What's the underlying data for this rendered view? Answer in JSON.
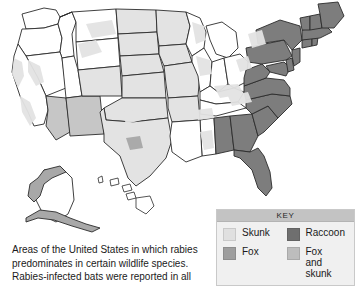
{
  "figure": {
    "kind": "thematic-map",
    "region": "United States"
  },
  "legend": {
    "header": "KEY",
    "entries": [
      {
        "label": "Skunk",
        "color": "#e0e0e0",
        "swatch_name": "swatch-skunk"
      },
      {
        "label": "Raccoon",
        "color": "#6f6f6f",
        "swatch_name": "swatch-raccoon"
      },
      {
        "label": "Fox",
        "color": "#9e9e9e",
        "swatch_name": "swatch-fox"
      },
      {
        "label": "Fox\nand skunk",
        "color": "#bdbdbd",
        "swatch_name": "swatch-fox-and-skunk"
      }
    ]
  },
  "caption": {
    "line1": "Areas of the United States in which rabies",
    "line2": "predominates in certain wildlife species.",
    "line3": "Rabies-infected bats were reported in all"
  },
  "map_data": {
    "type": "choropleth",
    "categories": [
      "Skunk",
      "Fox",
      "Raccoon",
      "Fox and skunk",
      "None"
    ],
    "colors": {
      "Skunk": "#e3e3e3",
      "Fox": "#a8a8a8",
      "Raccoon": "#7d7d7d",
      "Fox and skunk": "#c6c6c6",
      "None": "#ffffff"
    },
    "regions": [
      {
        "name": "Washington",
        "category": "None"
      },
      {
        "name": "Oregon",
        "category": "None"
      },
      {
        "name": "Idaho",
        "category": "None"
      },
      {
        "name": "Montana",
        "category": "None"
      },
      {
        "name": "Wyoming",
        "category": "None"
      },
      {
        "name": "Nevada",
        "category": "None"
      },
      {
        "name": "Utah",
        "category": "None"
      },
      {
        "name": "California",
        "category": "None"
      },
      {
        "name": "Arizona",
        "category": "Fox and skunk"
      },
      {
        "name": "New Mexico",
        "category": "Fox and skunk"
      },
      {
        "name": "Colorado",
        "category": "Skunk"
      },
      {
        "name": "North Dakota",
        "category": "Skunk"
      },
      {
        "name": "South Dakota",
        "category": "Skunk"
      },
      {
        "name": "Nebraska",
        "category": "Skunk"
      },
      {
        "name": "Kansas",
        "category": "Skunk"
      },
      {
        "name": "Oklahoma",
        "category": "Skunk"
      },
      {
        "name": "Texas",
        "category": "Skunk"
      },
      {
        "name": "Minnesota",
        "category": "Skunk"
      },
      {
        "name": "Iowa",
        "category": "Skunk"
      },
      {
        "name": "Missouri",
        "category": "Skunk"
      },
      {
        "name": "Arkansas",
        "category": "Skunk"
      },
      {
        "name": "Louisiana",
        "category": "None"
      },
      {
        "name": "Mississippi",
        "category": "None"
      },
      {
        "name": "Wisconsin",
        "category": "None"
      },
      {
        "name": "Illinois",
        "category": "None"
      },
      {
        "name": "Michigan",
        "category": "None"
      },
      {
        "name": "Indiana",
        "category": "None"
      },
      {
        "name": "Ohio",
        "category": "None"
      },
      {
        "name": "Kentucky",
        "category": "None"
      },
      {
        "name": "Tennessee",
        "category": "None"
      },
      {
        "name": "Alabama",
        "category": "Raccoon"
      },
      {
        "name": "Georgia",
        "category": "Raccoon"
      },
      {
        "name": "Florida",
        "category": "Raccoon"
      },
      {
        "name": "South Carolina",
        "category": "Raccoon"
      },
      {
        "name": "North Carolina",
        "category": "Raccoon"
      },
      {
        "name": "Virginia",
        "category": "Raccoon"
      },
      {
        "name": "West Virginia",
        "category": "Raccoon"
      },
      {
        "name": "Maryland",
        "category": "Raccoon"
      },
      {
        "name": "Delaware",
        "category": "Raccoon"
      },
      {
        "name": "Pennsylvania",
        "category": "Raccoon"
      },
      {
        "name": "New Jersey",
        "category": "Raccoon"
      },
      {
        "name": "New York",
        "category": "Raccoon"
      },
      {
        "name": "Connecticut",
        "category": "Raccoon"
      },
      {
        "name": "Rhode Island",
        "category": "Raccoon"
      },
      {
        "name": "Massachusetts",
        "category": "Raccoon"
      },
      {
        "name": "Vermont",
        "category": "Raccoon"
      },
      {
        "name": "New Hampshire",
        "category": "Raccoon"
      },
      {
        "name": "Maine",
        "category": "Raccoon"
      },
      {
        "name": "Alaska",
        "category": "Fox"
      },
      {
        "name": "Hawaii",
        "category": "None"
      }
    ]
  }
}
